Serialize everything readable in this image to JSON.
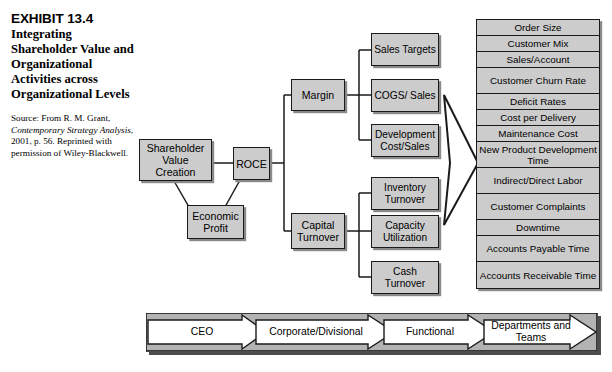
{
  "caption": {
    "exhibit_number": "EXHIBIT 13.4",
    "title": "Integrating Shareholder Value and Organizational Activities across Organizational Levels",
    "source_prefix": "Source: From R. M. Grant,",
    "source_italic": "Contemporary Strategy Analysis",
    "source_suffix": ", 2001, p. 56. Reprinted with permission of Wiley-Blackwell."
  },
  "diagram": {
    "level1": [
      {
        "id": "shareholder-value-creation",
        "label": "Shareholder Value Creation"
      },
      {
        "id": "economic-profit",
        "label": "Economic Profit"
      }
    ],
    "level2": [
      {
        "id": "roce",
        "label": "ROCE"
      }
    ],
    "level3": [
      {
        "id": "margin",
        "label": "Margin"
      },
      {
        "id": "capital-turnover",
        "label": "Capital Turnover"
      }
    ],
    "level4": [
      {
        "id": "sales-targets",
        "label": "Sales Targets"
      },
      {
        "id": "cogs-sales",
        "label": "COGS/ Sales"
      },
      {
        "id": "development-cost-sales",
        "label": "Development Cost/Sales"
      },
      {
        "id": "inventory-turnover",
        "label": "Inventory Turnover"
      },
      {
        "id": "capacity-utilization",
        "label": "Capacity Utilization"
      },
      {
        "id": "cash-turnover",
        "label": "Cash Turnover"
      }
    ],
    "metrics": [
      {
        "id": "order-size",
        "label": "Order Size",
        "lines": 1
      },
      {
        "id": "customer-mix",
        "label": "Customer Mix",
        "lines": 1
      },
      {
        "id": "sales-account",
        "label": "Sales/Account",
        "lines": 1
      },
      {
        "id": "customer-churn-rate",
        "label": "Customer Churn Rate",
        "lines": 2
      },
      {
        "id": "deficit-rates",
        "label": "Deficit Rates",
        "lines": 1
      },
      {
        "id": "cost-per-delivery",
        "label": "Cost per Delivery",
        "lines": 1
      },
      {
        "id": "maintenance-cost",
        "label": "Maintenance Cost",
        "lines": 1
      },
      {
        "id": "new-product-development-time",
        "label": "New Product Development Time",
        "lines": 2
      },
      {
        "id": "indirect-direct-labor",
        "label": "Indirect/Direct Labor",
        "lines": 2
      },
      {
        "id": "customer-complaints",
        "label": "Customer Complaints",
        "lines": 2
      },
      {
        "id": "downtime",
        "label": "Downtime",
        "lines": 1
      },
      {
        "id": "accounts-payable-time",
        "label": "Accounts Payable Time",
        "lines": 2
      },
      {
        "id": "accounts-receivable-time",
        "label": "Accounts Receivable Time",
        "lines": 2
      }
    ]
  },
  "level_band": {
    "arrows": [
      {
        "id": "ceo",
        "label": "CEO"
      },
      {
        "id": "corporate-divisional",
        "label": "Corporate/Divisional"
      },
      {
        "id": "functional",
        "label": "Functional"
      },
      {
        "id": "departments-and-teams",
        "label": "Departments and Teams"
      }
    ]
  },
  "colors": {
    "box_fill": "#cccccc",
    "box_border": "#1a1a1a",
    "box_shadow": "#8a8a8a",
    "band_fill": "#b3b3b3",
    "arrow_fill": "#ffffff",
    "page_background": "#ffffff"
  }
}
